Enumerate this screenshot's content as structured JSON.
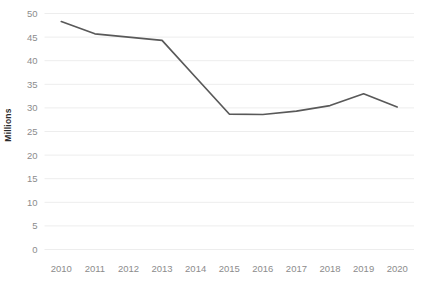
{
  "chart_data": {
    "type": "line",
    "title": "",
    "xlabel": "",
    "ylabel": "Millions",
    "categories": [
      "2010",
      "2011",
      "2012",
      "2013",
      "2014",
      "2015",
      "2016",
      "2017",
      "2018",
      "2019",
      "2020"
    ],
    "values": [
      48.3,
      45.7,
      45.0,
      44.3,
      36.5,
      28.7,
      28.6,
      29.3,
      30.5,
      33.0,
      30.2
    ],
    "series": [
      {
        "name": "",
        "values": [
          48.3,
          45.7,
          45.0,
          44.3,
          36.5,
          28.7,
          28.6,
          29.3,
          30.5,
          33.0,
          30.2
        ]
      }
    ],
    "ylim": [
      0,
      50
    ],
    "ytick_labels": [
      "0",
      "5",
      "10",
      "15",
      "20",
      "25",
      "30",
      "35",
      "40",
      "45",
      "50"
    ],
    "ytick_values": [
      0,
      5,
      10,
      15,
      20,
      25,
      30,
      35,
      40,
      45,
      50
    ],
    "xtick_labels": [
      "2010",
      "2011",
      "2012",
      "2013",
      "2014",
      "2015",
      "2016",
      "2017",
      "2018",
      "2019",
      "2020"
    ],
    "grid": true,
    "grid_axis": "y",
    "legend": false,
    "legend_position": "none",
    "markers": false,
    "line_color": "#595959",
    "grid_color": "#ededed",
    "tick_label_color": "#8c8c8c",
    "axis_title_color": "#2b2b2b",
    "background_color": "#ffffff"
  }
}
